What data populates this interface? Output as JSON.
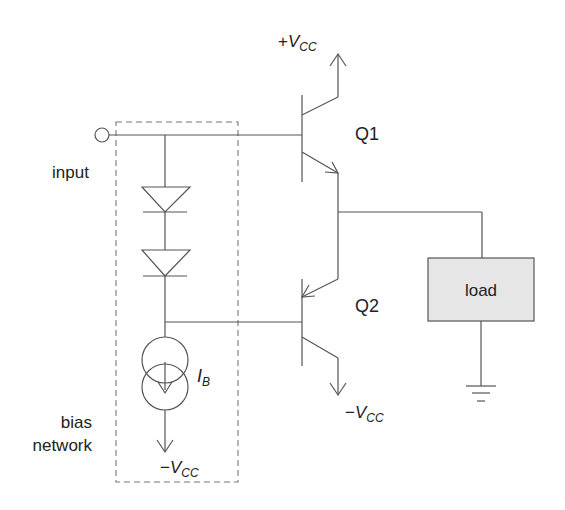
{
  "diagram": {
    "labels": {
      "input": "input",
      "bias_line1": "bias",
      "bias_line2": "network",
      "q1": "Q1",
      "q2": "Q2",
      "load": "load",
      "ib_main": "I",
      "ib_sub": "B",
      "vcc_pos_sign": "+",
      "vcc_neg_sign": "−",
      "vcc_main": "V",
      "vcc_sub": "CC"
    },
    "components": [
      {
        "id": "input-terminal",
        "type": "terminal"
      },
      {
        "id": "D1",
        "type": "diode"
      },
      {
        "id": "D2",
        "type": "diode"
      },
      {
        "id": "IB",
        "type": "current-source"
      },
      {
        "id": "Q1",
        "type": "npn-transistor"
      },
      {
        "id": "Q2",
        "type": "pnp-transistor"
      },
      {
        "id": "load",
        "type": "load-block"
      },
      {
        "id": "ground",
        "type": "ground"
      }
    ],
    "colors": {
      "wire": "#555555",
      "load_fill": "#e6e6e6",
      "dashed_box": "#777777"
    }
  }
}
